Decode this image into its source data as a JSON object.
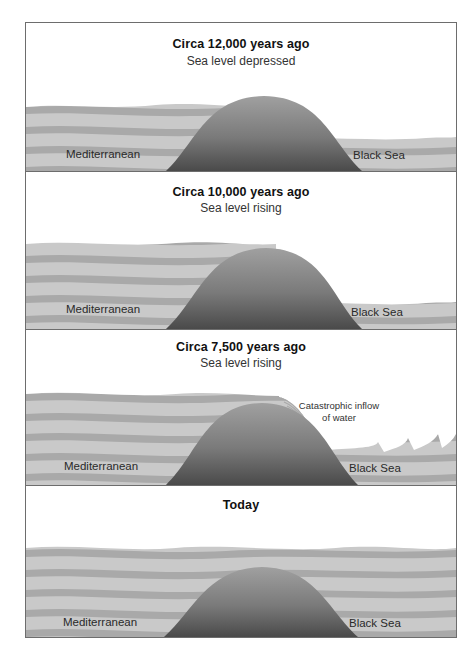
{
  "figure": {
    "panels": [
      {
        "id": "panel-12000",
        "title": "Circa 12,000 years ago",
        "subtitle": "Sea level depressed",
        "left_label": "Mediterranean",
        "right_label": "Black Sea"
      },
      {
        "id": "panel-10000",
        "title": "Circa 10,000 years ago",
        "subtitle": "Sea level rising",
        "left_label": "Mediterranean",
        "right_label": "Black Sea"
      },
      {
        "id": "panel-7500",
        "title": "Circa 7,500 years ago",
        "subtitle": "Sea level rising",
        "left_label": "Mediterranean",
        "right_label": "Black Sea",
        "annotation_line1": "Catastrophic inflow",
        "annotation_line2": "of water"
      },
      {
        "id": "panel-today",
        "title": "Today",
        "left_label": "Mediterranean",
        "right_label": "Black Sea"
      }
    ],
    "colors": {
      "frame": "#6d6d6d",
      "water_dark": "#a9a9a9",
      "water_light": "#c8c8c8",
      "land_top": "#9a9a9a",
      "land_bottom": "#4a4a4a"
    }
  }
}
